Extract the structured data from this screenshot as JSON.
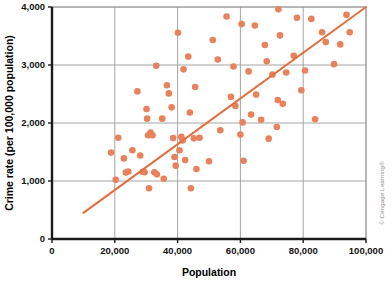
{
  "chart_data": {
    "type": "scatter",
    "title": "",
    "xlabel": "Population",
    "ylabel": "Crime rate (per 100,000 population)",
    "xlim": [
      0,
      100000
    ],
    "ylim": [
      0,
      4000
    ],
    "xticks": [
      0,
      20000,
      40000,
      60000,
      80000,
      100000
    ],
    "yticks": [
      0,
      1000,
      2000,
      3000,
      4000
    ],
    "xtick_labels": [
      "0",
      "20,000",
      "40,000",
      "60,000",
      "80,000",
      "100,000"
    ],
    "ytick_labels": [
      "0",
      "1,000",
      "2,000",
      "3,000",
      "4,000"
    ],
    "grid": true,
    "grid_color": "#9a9a9a",
    "legend": "none",
    "marker_color": "#e8825c",
    "marker_size": 4.6,
    "trendline": {
      "color": "#e0703f",
      "width": 2.1,
      "x": [
        10000,
        100000
      ],
      "y": [
        450,
        4000
      ]
    },
    "series": [
      {
        "name": "Cities",
        "points": [
          [
            18800,
            1490
          ],
          [
            20300,
            1020
          ],
          [
            21100,
            1745
          ],
          [
            22900,
            1390
          ],
          [
            23500,
            1145
          ],
          [
            24300,
            1165
          ],
          [
            25600,
            1530
          ],
          [
            27200,
            2545
          ],
          [
            28100,
            1440
          ],
          [
            28900,
            1160
          ],
          [
            29500,
            1150
          ],
          [
            30100,
            2240
          ],
          [
            30300,
            2075
          ],
          [
            30600,
            1790
          ],
          [
            30900,
            875
          ],
          [
            31400,
            1835
          ],
          [
            32000,
            1790
          ],
          [
            32600,
            1150
          ],
          [
            33200,
            2985
          ],
          [
            33400,
            1115
          ],
          [
            35100,
            2075
          ],
          [
            35600,
            1040
          ],
          [
            36600,
            2650
          ],
          [
            37200,
            2510
          ],
          [
            38100,
            2270
          ],
          [
            38600,
            1740
          ],
          [
            39000,
            1415
          ],
          [
            39400,
            1265
          ],
          [
            40100,
            3555
          ],
          [
            40600,
            1530
          ],
          [
            41200,
            1760
          ],
          [
            41600,
            1700
          ],
          [
            41900,
            2925
          ],
          [
            42400,
            1360
          ],
          [
            43400,
            3145
          ],
          [
            43900,
            2180
          ],
          [
            44200,
            875
          ],
          [
            45200,
            1735
          ],
          [
            45600,
            2620
          ],
          [
            46000,
            1205
          ],
          [
            47000,
            1745
          ],
          [
            50000,
            1340
          ],
          [
            51200,
            3430
          ],
          [
            52800,
            3095
          ],
          [
            53600,
            1875
          ],
          [
            55600,
            3835
          ],
          [
            57000,
            2450
          ],
          [
            57800,
            2975
          ],
          [
            58400,
            2295
          ],
          [
            60000,
            1800
          ],
          [
            60400,
            3705
          ],
          [
            60700,
            2010
          ],
          [
            61000,
            1350
          ],
          [
            62600,
            2890
          ],
          [
            63400,
            2145
          ],
          [
            64600,
            3680
          ],
          [
            65000,
            2490
          ],
          [
            66600,
            2055
          ],
          [
            67800,
            3345
          ],
          [
            68400,
            3065
          ],
          [
            69000,
            1730
          ],
          [
            70200,
            2835
          ],
          [
            71600,
            1930
          ],
          [
            71900,
            2395
          ],
          [
            72100,
            3960
          ],
          [
            72600,
            3510
          ],
          [
            73500,
            2330
          ],
          [
            74600,
            2870
          ],
          [
            77000,
            3160
          ],
          [
            78000,
            3815
          ],
          [
            79400,
            2565
          ],
          [
            80600,
            2905
          ],
          [
            82600,
            3795
          ],
          [
            83800,
            2065
          ],
          [
            86000,
            3565
          ],
          [
            87200,
            3395
          ],
          [
            89800,
            3015
          ],
          [
            91800,
            3355
          ],
          [
            93800,
            3865
          ],
          [
            94800,
            3565
          ]
        ]
      }
    ]
  },
  "credit": {
    "text": "© Cengage Learning®"
  }
}
